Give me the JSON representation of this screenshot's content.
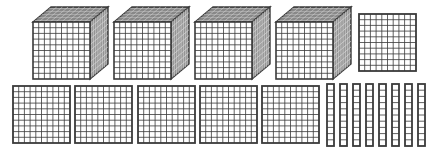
{
  "colors": {
    "line": "#3a3a3a",
    "fill": "#ffffff",
    "topShade": "#6a6a6a",
    "sideShade": "#8a8a8a"
  },
  "blocks": {
    "cubes": [
      {
        "x": 33,
        "y": 22,
        "size": 57
      },
      {
        "x": 114,
        "y": 22,
        "size": 57
      },
      {
        "x": 195,
        "y": 22,
        "size": 57
      },
      {
        "x": 276,
        "y": 22,
        "size": 57
      }
    ],
    "cube_depth": {
      "dx": 18,
      "dy": -15
    },
    "flats": [
      {
        "x": 359,
        "y": 14,
        "size": 57
      },
      {
        "x": 13,
        "y": 86,
        "size": 57
      },
      {
        "x": 75,
        "y": 86,
        "size": 57
      },
      {
        "x": 138,
        "y": 86,
        "size": 57
      },
      {
        "x": 200,
        "y": 86,
        "size": 57
      },
      {
        "x": 262,
        "y": 86,
        "size": 57
      }
    ],
    "rods": [
      {
        "x": 327,
        "y": 84
      },
      {
        "x": 340,
        "y": 84
      },
      {
        "x": 353,
        "y": 84
      },
      {
        "x": 366,
        "y": 84
      },
      {
        "x": 379,
        "y": 84
      },
      {
        "x": 392,
        "y": 84
      },
      {
        "x": 405,
        "y": 84
      },
      {
        "x": 418,
        "y": 84
      }
    ],
    "rod_size": {
      "w": 7,
      "h": 62
    },
    "counts": {
      "thousands": 4,
      "hundreds": 6,
      "tens": 8
    }
  }
}
